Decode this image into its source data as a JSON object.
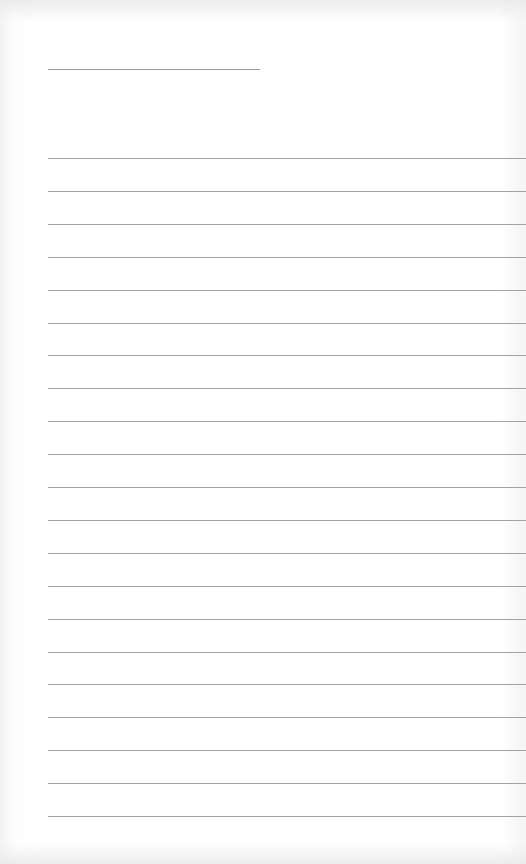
{
  "document": {
    "type": "lined-paper",
    "title_line": {
      "present": true
    },
    "writing_lines": {
      "count": 21,
      "first_y": 158,
      "spacing": 32.9
    },
    "colors": {
      "paper": "#ffffff",
      "rule": "#a3a3a3"
    }
  }
}
